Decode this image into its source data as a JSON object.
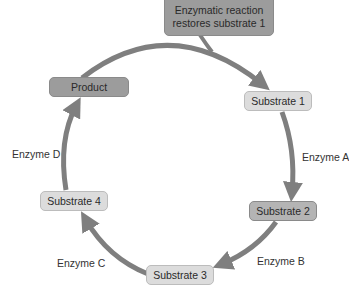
{
  "diagram": {
    "type": "enzymatic-cycle",
    "colors": {
      "arrow": "#7f7f7f",
      "dark_box": "#9c9c9c",
      "light_box": "#dcdcdc",
      "text": "#2a2a2a"
    },
    "callout": {
      "text": "Enzymatic reaction restores substrate 1",
      "line1": "Enzymatic reaction",
      "line2": "restores substrate 1"
    },
    "nodes": {
      "product": "Product",
      "substrate1": "Substrate 1",
      "substrate2": "Substrate 2",
      "substrate3": "Substrate 3",
      "substrate4": "Substrate 4"
    },
    "enzymes": {
      "a": "Enzyme A",
      "b": "Enzyme B",
      "c": "Enzyme C",
      "d": "Enzyme D"
    },
    "edges": [
      {
        "from": "Product",
        "to": "Substrate 1",
        "label": "Enzymatic reaction restores substrate 1"
      },
      {
        "from": "Substrate 1",
        "to": "Substrate 2",
        "label": "Enzyme A"
      },
      {
        "from": "Substrate 2",
        "to": "Substrate 3",
        "label": "Enzyme B"
      },
      {
        "from": "Substrate 3",
        "to": "Substrate 4",
        "label": "Enzyme C"
      },
      {
        "from": "Substrate 4",
        "to": "Product",
        "label": "Enzyme D"
      }
    ]
  }
}
